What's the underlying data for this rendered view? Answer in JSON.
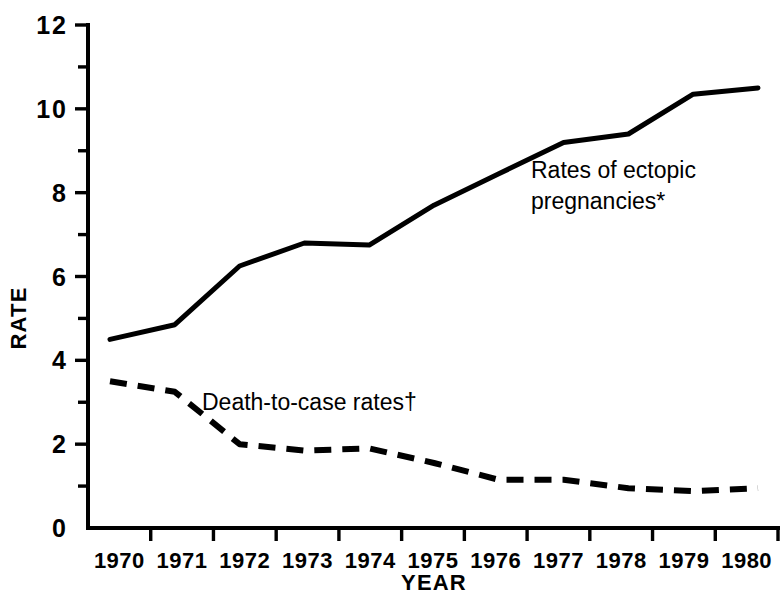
{
  "chart_data": {
    "type": "line",
    "title": "",
    "xlabel": "YEAR",
    "ylabel": "RATE",
    "x": [
      1970,
      1971,
      1972,
      1973,
      1974,
      1975,
      1976,
      1977,
      1978,
      1979,
      1980
    ],
    "categories": [
      "1970",
      "1971",
      "1972",
      "1973",
      "1974",
      "1975",
      "1976",
      "1977",
      "1978",
      "1979",
      "1980"
    ],
    "xlim": [
      1970,
      1980
    ],
    "ylim": [
      0,
      12
    ],
    "grid": false,
    "legend_position": "inline-annotation",
    "y_ticks_major": [
      0,
      2,
      4,
      6,
      8,
      10,
      12
    ],
    "y_ticks_minor": [
      1,
      3,
      5,
      7,
      9,
      11
    ],
    "y_tick_labels": [
      "0",
      "2",
      "4",
      "6",
      "8",
      "10",
      "12"
    ],
    "series": [
      {
        "name": "Rates of ectopic pregnancies*",
        "style": "solid",
        "values": [
          4.5,
          4.85,
          6.25,
          6.8,
          6.75,
          7.7,
          8.45,
          9.2,
          9.4,
          10.35,
          10.5
        ]
      },
      {
        "name": "Death-to-case rates†",
        "style": "dashed",
        "values": [
          3.5,
          3.25,
          2.0,
          1.85,
          1.9,
          1.55,
          1.15,
          1.15,
          0.95,
          0.88,
          0.95
        ]
      }
    ],
    "annotations": [
      {
        "name": "ectopic-pregnancies-label",
        "lines": [
          "Rates of ectopic",
          "pregnancies*"
        ],
        "x": 531,
        "y": 178
      },
      {
        "name": "death-to-case-label",
        "lines": [
          "Death-to-case rates†"
        ],
        "x": 202,
        "y": 410
      }
    ]
  },
  "axes": {
    "y_title": "RATE",
    "x_title": "YEAR"
  },
  "colors": {
    "ink": "#000000",
    "background": "#ffffff"
  }
}
